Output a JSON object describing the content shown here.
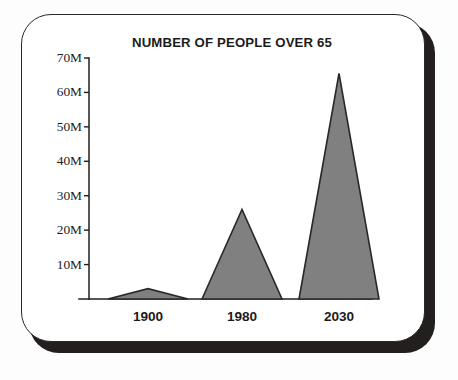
{
  "chart_data": {
    "type": "area",
    "title": "NUMBER OF PEOPLE OVER 65",
    "xlabel": "",
    "ylabel": "",
    "categories": [
      "1900",
      "1980",
      "2030"
    ],
    "values": [
      3,
      26,
      65.5
    ],
    "value_unit": "millions",
    "ylim": [
      0,
      70
    ],
    "ytick_values": [
      10,
      20,
      30,
      40,
      50,
      60,
      70
    ],
    "ytick_labels": [
      "10M",
      "20M",
      "30M",
      "40M",
      "50M",
      "60M",
      "70M"
    ],
    "xtick_labels": [
      "1900",
      "1980",
      "2030"
    ],
    "grid": false,
    "legend": null,
    "series": [
      {
        "name": "People over 65",
        "values": [
          3,
          26,
          65.5
        ]
      }
    ],
    "marks": [
      {
        "label": "1900",
        "value": 3,
        "peak_x": 59,
        "half_width": 40
      },
      {
        "label": "1980",
        "value": 26,
        "peak_x": 153,
        "half_width": 40
      },
      {
        "label": "2030",
        "value": 65.5,
        "peak_x": 250,
        "half_width": 40
      }
    ],
    "colors": {
      "fill": "#808080",
      "stroke": "#2b2726",
      "axis": "#201d1c",
      "text": "#1d1b1a",
      "background": "#ffffff",
      "frame": "#2b2726",
      "shadow": "#231f1e"
    }
  }
}
